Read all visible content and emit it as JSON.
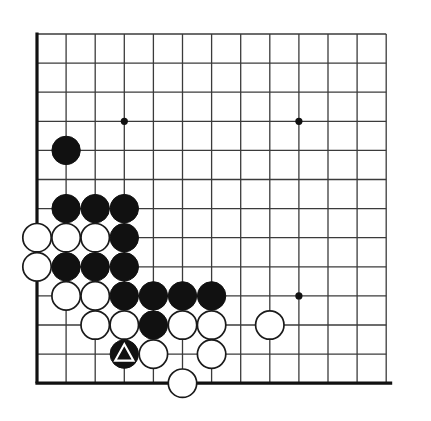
{
  "board": {
    "kind": "go-board-diagram",
    "description": "Go problem diagram, bottom-left corner",
    "background_color": "#ffffff",
    "line_color": "#3b3b3b",
    "edge_line_color": "#111111",
    "black_color": "#111111",
    "white_color": "#ffffff",
    "white_outline_color": "#1a1a1a",
    "columns": 13,
    "rows": 13,
    "origin_x": 37,
    "origin_y": 34,
    "spacing": 29.1,
    "stone_radius": 14.2,
    "line_width": 1.3,
    "edge_line_width": 3.2,
    "edges": {
      "left": true,
      "bottom": true,
      "top": false,
      "right": false
    },
    "star_points": [
      {
        "col": 4,
        "row": 4
      },
      {
        "col": 10,
        "row": 4
      },
      {
        "col": 10,
        "row": 10
      }
    ],
    "star_point_radius": 3.6,
    "stones": [
      {
        "col": 2,
        "row": 5,
        "color": "black",
        "mark": "none"
      },
      {
        "col": 2,
        "row": 7,
        "color": "black",
        "mark": "none"
      },
      {
        "col": 3,
        "row": 7,
        "color": "black",
        "mark": "none"
      },
      {
        "col": 4,
        "row": 7,
        "color": "black",
        "mark": "none"
      },
      {
        "col": 1,
        "row": 8,
        "color": "white",
        "mark": "none"
      },
      {
        "col": 2,
        "row": 8,
        "color": "white",
        "mark": "none"
      },
      {
        "col": 3,
        "row": 8,
        "color": "white",
        "mark": "none"
      },
      {
        "col": 4,
        "row": 8,
        "color": "black",
        "mark": "none"
      },
      {
        "col": 1,
        "row": 9,
        "color": "white",
        "mark": "none"
      },
      {
        "col": 2,
        "row": 9,
        "color": "black",
        "mark": "none"
      },
      {
        "col": 3,
        "row": 9,
        "color": "black",
        "mark": "none"
      },
      {
        "col": 4,
        "row": 9,
        "color": "black",
        "mark": "none"
      },
      {
        "col": 2,
        "row": 10,
        "color": "white",
        "mark": "none"
      },
      {
        "col": 3,
        "row": 10,
        "color": "white",
        "mark": "none"
      },
      {
        "col": 4,
        "row": 10,
        "color": "black",
        "mark": "none"
      },
      {
        "col": 5,
        "row": 10,
        "color": "black",
        "mark": "none"
      },
      {
        "col": 6,
        "row": 10,
        "color": "black",
        "mark": "none"
      },
      {
        "col": 7,
        "row": 10,
        "color": "black",
        "mark": "none"
      },
      {
        "col": 3,
        "row": 11,
        "color": "white",
        "mark": "none"
      },
      {
        "col": 4,
        "row": 11,
        "color": "white",
        "mark": "none"
      },
      {
        "col": 5,
        "row": 11,
        "color": "black",
        "mark": "none"
      },
      {
        "col": 6,
        "row": 11,
        "color": "white",
        "mark": "none"
      },
      {
        "col": 7,
        "row": 11,
        "color": "white",
        "mark": "none"
      },
      {
        "col": 9,
        "row": 11,
        "color": "white",
        "mark": "none"
      },
      {
        "col": 4,
        "row": 12,
        "color": "black",
        "mark": "triangle"
      },
      {
        "col": 5,
        "row": 12,
        "color": "white",
        "mark": "none"
      },
      {
        "col": 7,
        "row": 12,
        "color": "white",
        "mark": "none"
      },
      {
        "col": 6,
        "row": 13,
        "color": "white",
        "mark": "none"
      }
    ]
  }
}
